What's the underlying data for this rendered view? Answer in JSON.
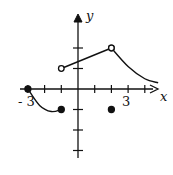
{
  "chart_data": {
    "type": "line",
    "title": "",
    "xlabel": "x",
    "ylabel": "y",
    "xlim": [
      -3.3,
      5
    ],
    "ylim": [
      -3,
      4
    ],
    "grid": false,
    "tick_labels": {
      "x": [
        "-3",
        "3"
      ]
    },
    "x_ticks": [
      -3,
      -2,
      -1,
      1,
      2,
      3,
      4
    ],
    "y_ticks": [
      -3,
      -2,
      -1,
      1,
      2
    ],
    "series": [
      {
        "name": "piece-1-curve",
        "style": "curve",
        "points": [
          [
            -3,
            0
          ],
          [
            -2.3,
            -0.8
          ],
          [
            -1.6,
            -1.1
          ],
          [
            -1,
            -1
          ]
        ],
        "endpoints": [
          {
            "x": -3,
            "y": 0,
            "type": "closed"
          },
          {
            "x": -1,
            "y": -1,
            "type": "closed"
          }
        ]
      },
      {
        "name": "piece-2-line",
        "style": "line",
        "points": [
          [
            -1,
            1
          ],
          [
            2,
            2
          ]
        ],
        "endpoints": [
          {
            "x": -1,
            "y": 1,
            "type": "open"
          },
          {
            "x": 2,
            "y": 2,
            "type": "open"
          }
        ]
      },
      {
        "name": "piece-3-curve",
        "style": "curve",
        "points": [
          [
            2,
            2
          ],
          [
            3,
            1.1
          ],
          [
            4,
            0.5
          ],
          [
            4.8,
            0.3
          ]
        ],
        "endpoints": [
          {
            "x": 2,
            "y": 2,
            "type": "open"
          }
        ]
      },
      {
        "name": "isolated-point",
        "style": "point",
        "points": [
          [
            2,
            -1
          ]
        ],
        "endpoints": [
          {
            "x": 2,
            "y": -1,
            "type": "closed"
          }
        ]
      }
    ]
  },
  "labels": {
    "x_axis": "x",
    "y_axis": "y",
    "neg_three": "- 3",
    "pos_three": "3"
  }
}
